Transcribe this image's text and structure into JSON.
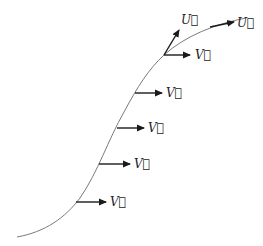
{
  "diagram": {
    "colors": {
      "curve": "#7a7a7a",
      "arrow": "#1a1a1a",
      "label": "#222222"
    },
    "curve_path": "M17,237 C45,232 65,218 80,198 C98,172 108,140 124,112 C138,86 148,70 164,55 C185,36 215,24 246,18",
    "labels": {
      "U_tangent_upper": "U⃗",
      "U_tangent_far": "U⃗",
      "V": "V⃗"
    },
    "vectors_V": [
      {
        "name": "v-arrow-1",
        "x1": 164,
        "y1": 55,
        "x2": 190,
        "y2": 55,
        "label": "V⃗",
        "lx": 195,
        "ly": 59
      },
      {
        "name": "v-arrow-2",
        "x1": 135,
        "y1": 93,
        "x2": 162,
        "y2": 93,
        "label": "V⃗",
        "lx": 166,
        "ly": 97
      },
      {
        "name": "v-arrow-3",
        "x1": 117,
        "y1": 128,
        "x2": 144,
        "y2": 128,
        "label": "V⃗",
        "lx": 148,
        "ly": 132
      },
      {
        "name": "v-arrow-4",
        "x1": 99,
        "y1": 164,
        "x2": 130,
        "y2": 164,
        "label": "V⃗",
        "lx": 134,
        "ly": 168
      },
      {
        "name": "v-arrow-5",
        "x1": 76,
        "y1": 202,
        "x2": 106,
        "y2": 202,
        "label": "V⃗",
        "lx": 110,
        "ly": 206
      }
    ],
    "vectors_U": [
      {
        "name": "u-arrow-upper",
        "x1": 164,
        "y1": 55,
        "x2": 179,
        "y2": 30,
        "label": "U⃗",
        "lx": 181,
        "ly": 24
      },
      {
        "name": "u-arrow-far",
        "x1": 210,
        "y1": 27,
        "x2": 234,
        "y2": 22,
        "label": "U⃗",
        "lx": 237,
        "ly": 27
      }
    ]
  }
}
